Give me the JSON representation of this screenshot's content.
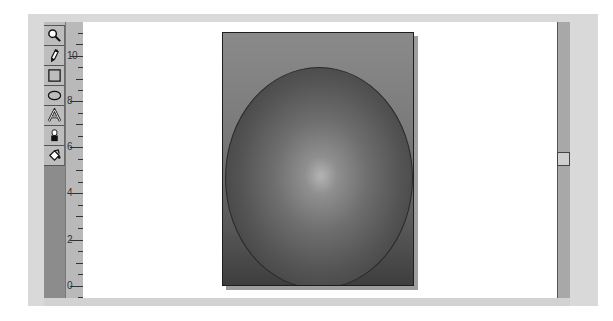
{
  "window": {
    "frame_color": "#d9d9d9",
    "canvas_color": "#ffffff"
  },
  "toolbox": {
    "tools": [
      {
        "id": "zoom",
        "icon": "magnifier-icon",
        "label": "Zoom"
      },
      {
        "id": "pen",
        "icon": "pen-icon",
        "label": "Pen"
      },
      {
        "id": "rectangle",
        "icon": "rectangle-icon",
        "label": "Rectangle"
      },
      {
        "id": "ellipse",
        "icon": "ellipse-icon",
        "label": "Ellipse"
      },
      {
        "id": "text",
        "icon": "text-icon",
        "label": "Text"
      },
      {
        "id": "ink",
        "icon": "ink-bottle-icon",
        "label": "Ink"
      },
      {
        "id": "fill",
        "icon": "paint-bucket-icon",
        "label": "Fill"
      }
    ]
  },
  "ruler": {
    "orientation": "vertical",
    "labels": [
      {
        "text": "10",
        "y": 56
      },
      {
        "text": "8",
        "y": 101
      },
      {
        "text": "6",
        "y": 147
      },
      {
        "text": "4",
        "y": 193
      },
      {
        "text": "2",
        "y": 240
      },
      {
        "text": "0",
        "y": 286
      }
    ]
  },
  "artboard": {
    "content": "gradient sphere on gradient background",
    "background_top": "#8a8a8a",
    "background_bottom": "#3e3e3e",
    "sphere_highlight": "#b4b4b4",
    "sphere_edge": "#353535"
  },
  "scrollbar": {
    "orientation": "vertical",
    "thumb_position_percent": 47
  }
}
